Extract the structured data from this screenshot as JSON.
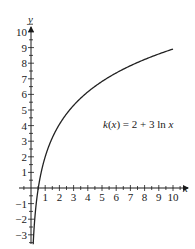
{
  "chart_data": {
    "type": "line",
    "title": "",
    "xlabel": "x",
    "ylabel": "y",
    "xlim": [
      -1,
      10.5
    ],
    "ylim": [
      -3.6,
      11
    ],
    "grid": false,
    "x_ticks": [
      1,
      2,
      3,
      4,
      5,
      6,
      7,
      8,
      9,
      10
    ],
    "y_ticks": [
      -3,
      -2,
      -1,
      1,
      2,
      3,
      4,
      5,
      6,
      7,
      8,
      9,
      10
    ],
    "series": [
      {
        "name": "k(x) = 2 + 3 ln x",
        "function": "2 + 3*ln(x)",
        "x": [
          0.3,
          0.5,
          1,
          2,
          3,
          4,
          5,
          6,
          7,
          8,
          9,
          10
        ],
        "values": [
          -1.61,
          -0.08,
          2.0,
          4.08,
          5.3,
          6.16,
          6.83,
          7.38,
          7.84,
          8.24,
          8.59,
          8.91
        ]
      }
    ],
    "annotations": [
      {
        "text": "k(x) = 2 + 3 ln x",
        "x": 6.3,
        "y": 5.2
      }
    ]
  },
  "labels": {
    "y_axis": "y",
    "x_axis": "x",
    "function": "k(x) = 2 + 3 ln x"
  }
}
